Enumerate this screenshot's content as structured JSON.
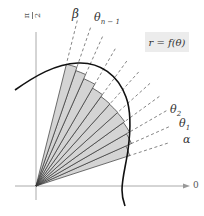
{
  "figure": {
    "type": "polar-area-riemann-sectors",
    "curve_label": "r = f(θ)",
    "axis_labels": {
      "vertical_numerator": "π",
      "vertical_denominator": "2",
      "horizontal": "0"
    },
    "angle_labels": {
      "alpha": "α",
      "theta1_base": "θ",
      "theta1_sub": "1",
      "theta2_base": "θ",
      "theta2_sub": "2",
      "theta_n_minus_1_base": "θ",
      "theta_n_minus_1_sub": "n − 1",
      "beta": "β"
    },
    "colors": {
      "sector_fill": "#d4d4d4",
      "sector_edge": "#333333",
      "curve": "#111111",
      "axis": "#999999",
      "dashed": "#666666",
      "label_box": "#ececec"
    },
    "origin": [
      36,
      186
    ],
    "sector_angles_deg": [
      18,
      24,
      30,
      36,
      42,
      48,
      54,
      60,
      66,
      71,
      76
    ],
    "sector_radii_px": [
      95,
      102,
      107,
      109,
      110,
      110,
      111,
      115,
      120,
      124,
      127
    ]
  }
}
